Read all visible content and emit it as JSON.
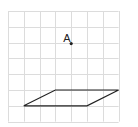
{
  "diagram": {
    "type": "grid-geometry",
    "grid": {
      "origin_px": [
        8,
        11
      ],
      "cell_px": 15.8,
      "columns": 7,
      "rows": 7,
      "line_color": "#dcdcdc"
    },
    "point": {
      "label": "A",
      "grid_xy": [
        4,
        2
      ],
      "color": "#222222"
    },
    "parallelogram": {
      "vertices_grid": [
        [
          1,
          6
        ],
        [
          5,
          6
        ],
        [
          7,
          5
        ],
        [
          3,
          5
        ]
      ],
      "stroke_color": "#222222"
    }
  }
}
